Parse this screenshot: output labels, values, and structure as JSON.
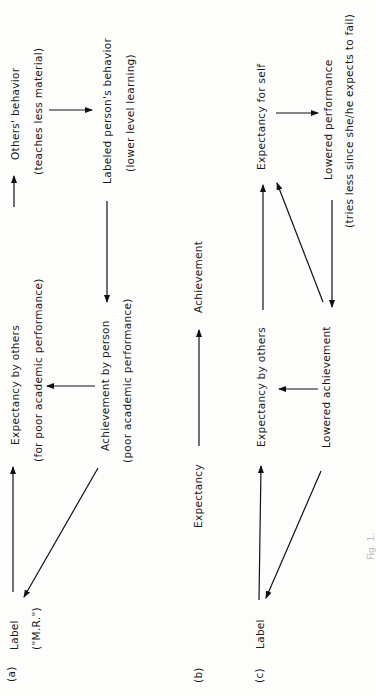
{
  "panel_a": {
    "tag": "(a)",
    "label": "Label",
    "label_sub": "(\"M.R.\")",
    "expectancy": "Expectancy by others",
    "expectancy_sub": "(for poor academic performance)",
    "others_behavior": "Others' behavior",
    "others_behavior_sub": "(teaches less material)",
    "labeled_behavior": "Labeled person's behavior",
    "labeled_behavior_sub": "(lower level learning)",
    "achievement": "Achievement by person",
    "achievement_sub": "(poor academic performance)"
  },
  "panel_b": {
    "tag": "(b)",
    "expectancy": "Expectancy",
    "achievement": "Achievement"
  },
  "panel_c": {
    "tag": "(c)",
    "label": "Label",
    "expectancy_others": "Expectancy by others",
    "expectancy_self": "Expectancy for self",
    "lowered_performance": "Lowered performance",
    "lowered_performance_sub": "(tries less since she/he expects to fail)",
    "lowered_achievement": "Lowered achievement"
  },
  "caption": "Fig. 1."
}
